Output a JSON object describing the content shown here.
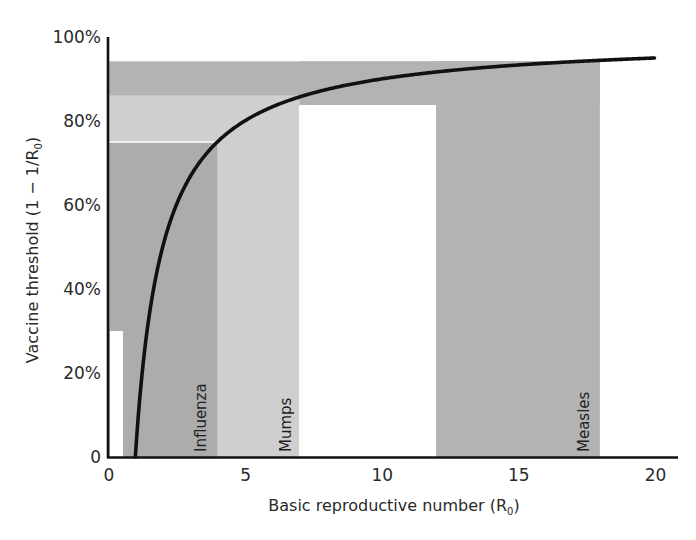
{
  "chart_data": {
    "type": "line",
    "title": "",
    "xlabel": "Basic reproductive number (R0)",
    "xlabel_main": "Basic reproductive number (R",
    "xlabel_sub": "0",
    "xlabel_end": ")",
    "ylabel": "Vaccine threshold (1 − 1/R0)",
    "ylabel_main": "Vaccine threshold (1 − 1/R",
    "ylabel_sub": "0",
    "ylabel_end": ")",
    "xlim": [
      0,
      20
    ],
    "ylim": [
      0,
      100
    ],
    "x_ticks": [
      0,
      5,
      10,
      15,
      20
    ],
    "x_tick_labels": [
      "0",
      "5",
      "10",
      "15",
      "20"
    ],
    "y_ticks": [
      0,
      20,
      40,
      60,
      80,
      100
    ],
    "y_tick_labels": [
      "0",
      "20%",
      "40%",
      "60%",
      "80%",
      "100%"
    ],
    "grid": false,
    "legend": null,
    "series": [
      {
        "name": "Vaccine threshold curve 1 - 1/R0",
        "formula": "1 - 1/R0",
        "color": "#111111",
        "x": [
          1,
          1.25,
          1.5,
          2,
          2.5,
          3,
          4,
          5,
          6,
          7,
          8,
          10,
          12,
          14,
          16,
          18,
          20
        ],
        "y": [
          0,
          20,
          33.3,
          50,
          60,
          66.7,
          75,
          80,
          83.3,
          85.7,
          87.5,
          90,
          91.7,
          92.9,
          93.75,
          94.4,
          95
        ]
      }
    ],
    "shaded_regions": [
      {
        "name": "Measles",
        "label": "Measles",
        "r0_range": [
          12,
          18
        ],
        "threshold_range": [
          83.8,
          94.2
        ],
        "color": "#b3b3b3"
      },
      {
        "name": "Mumps",
        "label": "Mumps",
        "r0_range": [
          4,
          7
        ],
        "threshold_range": [
          75,
          86
        ],
        "color": "#cfcfcf"
      },
      {
        "name": "Influenza",
        "label": "Influenza",
        "r0_range": [
          0.55,
          4
        ],
        "threshold_range": [
          0,
          75
        ],
        "color": "#acacac"
      }
    ],
    "colors": {
      "measles": "#b3b3b3",
      "mumps": "#cfcfcf",
      "influenza": "#acacac",
      "white_gap": "#ffffff",
      "axis": "#111111",
      "curve": "#111111"
    }
  }
}
